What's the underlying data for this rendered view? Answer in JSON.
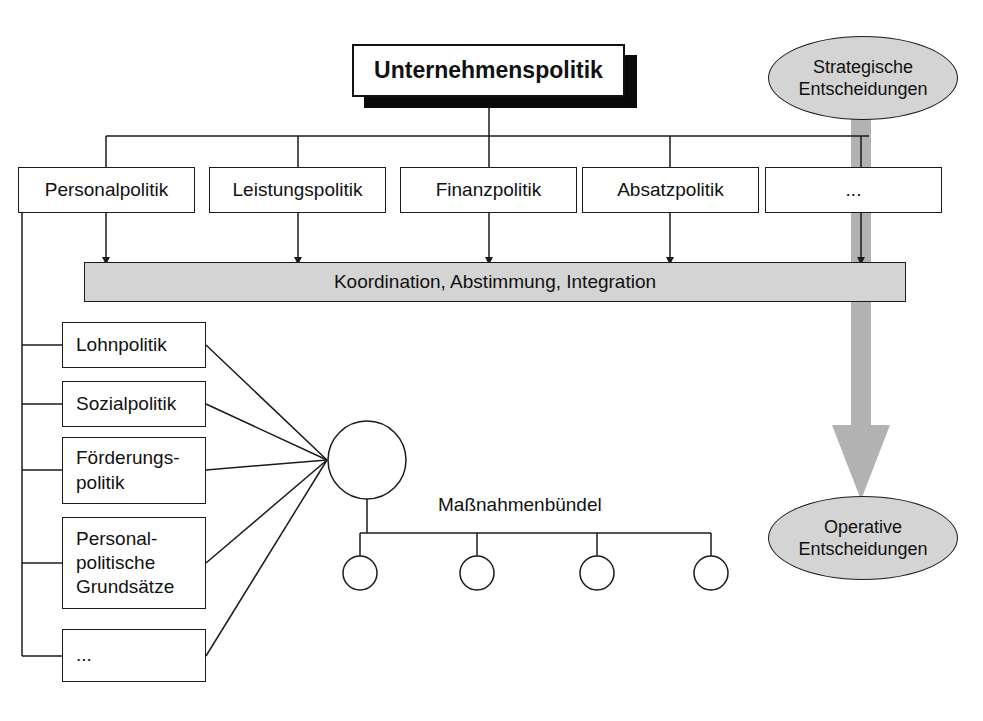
{
  "diagram": {
    "title_node": {
      "label": "Unternehmenspolitik"
    },
    "policy_row": [
      {
        "label": "Personalpolitik"
      },
      {
        "label": "Leistungspolitik"
      },
      {
        "label": "Finanzpolitik"
      },
      {
        "label": "Absatzpolitik"
      },
      {
        "label": "..."
      }
    ],
    "coordination_bar": {
      "label": "Koordination, Abstimmung, Integration"
    },
    "personnel_subpolicies": [
      {
        "label": "Lohnpolitik"
      },
      {
        "label": "Sozialpolitik"
      },
      {
        "label": "Förderungs-\npolitik"
      },
      {
        "label": "Personal-\npolitische\nGrundsätze"
      },
      {
        "label": "..."
      }
    ],
    "bundle": {
      "label": "Maßnahmenbündel",
      "measure_count": 4
    },
    "decision_nodes": {
      "strategic": {
        "label": "Strategische\nEntscheidungen"
      },
      "operative": {
        "label": "Operative\nEntscheidungen"
      }
    },
    "colors": {
      "fill_gray": "#d4d4d4",
      "arrow_gray": "#b2b2b2",
      "line": "#1b1b1b",
      "shadow": "#0a0a0a",
      "page_background": "#ffffff"
    }
  }
}
